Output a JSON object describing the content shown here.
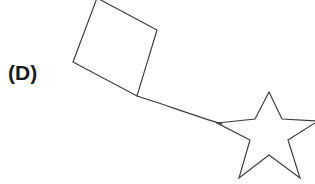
{
  "figure": {
    "panel_label": "(D)",
    "background_color": "#ffffff",
    "stroke_color": "#3a3a3a",
    "label_color": "#1a1a1a",
    "width": 315,
    "height": 184,
    "shapes": [
      {
        "name": "square",
        "kind": "quadrilateral",
        "points": "97,-2 157,30 137,96 73,62",
        "description": "rotated square, top vertex clipped by top image edge"
      },
      {
        "name": "star",
        "kind": "five-pointed-star",
        "points": "269,92 282,119 318,121 288,140 300,178 269,155 239,178 250,140 217,123 255,119",
        "description": "five pointed star, right point clipped by right image edge"
      }
    ],
    "connector": {
      "name": "connector",
      "path": "M137,96 C163,104 192,115 222,124",
      "from_shape": "square",
      "to_shape": "star",
      "description": "line joining square bottom vertex to star left inner region"
    }
  }
}
